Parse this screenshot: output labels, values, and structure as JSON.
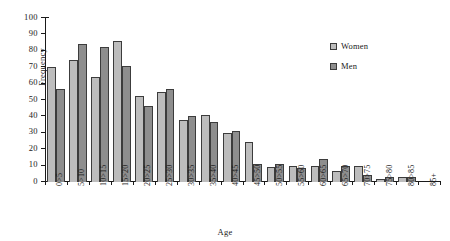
{
  "chart_data": {
    "type": "bar",
    "title": "",
    "xlabel": "Age",
    "ylabel": "Frequency",
    "ylim": [
      0,
      100
    ],
    "yticks": [
      0,
      10,
      20,
      30,
      40,
      50,
      60,
      70,
      80,
      90,
      100
    ],
    "grid": false,
    "legend_position": "upper-right",
    "categories": [
      "0>5",
      "5>10",
      "10>15",
      "15>20",
      "20>25",
      "25>30",
      "30>35",
      "35>40",
      "40>45",
      "45>50",
      "50>55",
      "55>60",
      "60>65",
      "65>70",
      "70>75",
      "75>80",
      "80>85",
      "85+"
    ],
    "series": [
      {
        "name": "Women",
        "color": "#bdbdbd",
        "values": [
          70,
          74.5,
          64,
          86,
          52.5,
          55,
          38,
          41,
          30,
          24.5,
          9,
          10,
          10,
          7,
          9.5,
          2,
          3,
          0
        ]
      },
      {
        "name": "Men",
        "color": "#8e8e8e",
        "values": [
          56.5,
          84,
          82.5,
          71,
          46.5,
          56.5,
          40,
          36.5,
          31,
          11,
          11,
          8.5,
          14,
          10,
          4,
          3,
          3,
          0
        ]
      }
    ]
  },
  "legend": {
    "items": [
      {
        "label": "Women"
      },
      {
        "label": "Men"
      }
    ]
  }
}
